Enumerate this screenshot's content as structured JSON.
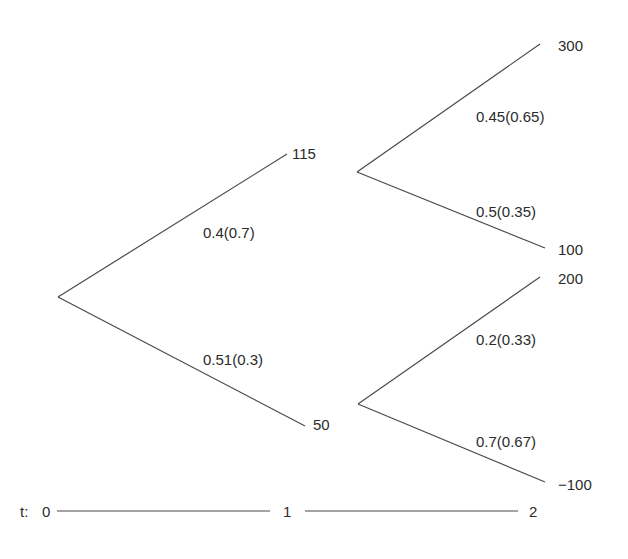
{
  "tree": {
    "nodes": {
      "t1_up": "115",
      "t1_down": "50",
      "t2_up_up": "300",
      "t2_up_down": "100",
      "t2_down_up": "200",
      "t2_down_down": "−100"
    },
    "branch_labels": {
      "root_up": "0.4(0.7)",
      "root_down": "0.51(0.3)",
      "up_up": "0.45(0.65)",
      "up_down": "0.5(0.35)",
      "down_up": "0.2(0.33)",
      "down_down": "0.7(0.67)"
    }
  },
  "timeline": {
    "prefix": "t:",
    "t0": "0",
    "t1": "1",
    "t2": "2"
  },
  "colors": {
    "line": "#4a4a4a",
    "text": "#2b2b2b"
  }
}
